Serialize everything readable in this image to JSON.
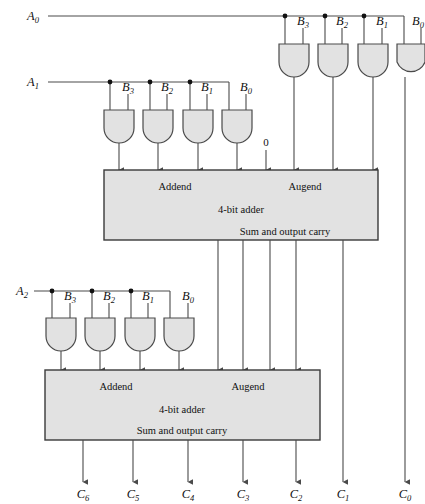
{
  "diagram": {
    "type": "logic-circuit-schematic",
    "colors": {
      "wire": "#4a4a4a",
      "gate_fill": "#e2e2e2",
      "box_fill": "#e2e2e2",
      "box_stroke": "#3a3a3a",
      "text": "#111111",
      "background": "#ffffff"
    },
    "multiplicand_inputs": [
      {
        "base": "A",
        "sub": "0",
        "y": 16
      },
      {
        "base": "A",
        "sub": "1",
        "y": 82
      },
      {
        "base": "A",
        "sub": "2",
        "y": 291
      }
    ],
    "gate_rows": [
      {
        "row_id": "row-a0",
        "driver": "A0",
        "gates": [
          {
            "id": "g-a0-b3",
            "b_base": "B",
            "b_sub": "3"
          },
          {
            "id": "g-a0-b2",
            "b_base": "B",
            "b_sub": "2"
          },
          {
            "id": "g-a0-b1",
            "b_base": "B",
            "b_sub": "1"
          },
          {
            "id": "g-a0-b0",
            "b_base": "B",
            "b_sub": "0"
          }
        ]
      },
      {
        "row_id": "row-a1",
        "driver": "A1",
        "gates": [
          {
            "id": "g-a1-b3",
            "b_base": "B",
            "b_sub": "3"
          },
          {
            "id": "g-a1-b2",
            "b_base": "B",
            "b_sub": "2"
          },
          {
            "id": "g-a1-b1",
            "b_base": "B",
            "b_sub": "1"
          },
          {
            "id": "g-a1-b0",
            "b_base": "B",
            "b_sub": "0"
          }
        ]
      },
      {
        "row_id": "row-a2",
        "driver": "A2",
        "gates": [
          {
            "id": "g-a2-b3",
            "b_base": "B",
            "b_sub": "3"
          },
          {
            "id": "g-a2-b2",
            "b_base": "B",
            "b_sub": "2"
          },
          {
            "id": "g-a2-b1",
            "b_base": "B",
            "b_sub": "1"
          },
          {
            "id": "g-a2-b0",
            "b_base": "B",
            "b_sub": "0"
          }
        ]
      }
    ],
    "adders": [
      {
        "id": "adder-1",
        "addend_label": "Addend",
        "augend_label": "Augend",
        "name_label": "4-bit adder",
        "output_label": "Sum and output carry"
      },
      {
        "id": "adder-2",
        "addend_label": "Addend",
        "augend_label": "Augend",
        "name_label": "4-bit adder",
        "output_label": "Sum and output carry"
      }
    ],
    "carry_in_label": "0",
    "outputs": [
      {
        "base": "C",
        "sub": "6",
        "x": 83
      },
      {
        "base": "C",
        "sub": "5",
        "x": 133
      },
      {
        "base": "C",
        "sub": "4",
        "x": 188
      },
      {
        "base": "C",
        "sub": "3",
        "x": 243
      },
      {
        "base": "C",
        "sub": "2",
        "x": 296
      },
      {
        "base": "C",
        "sub": "1",
        "x": 343
      },
      {
        "base": "C",
        "sub": "0",
        "x": 405
      }
    ]
  }
}
